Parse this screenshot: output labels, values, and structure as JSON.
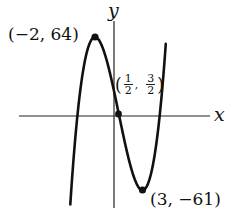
{
  "chart_data": {
    "type": "line",
    "title": "",
    "xlabel": "x",
    "ylabel": "y",
    "function": "cubic with local max (-2, 64), inflection (1/2, 3/2), local min (3, -61)",
    "grid": false,
    "legend": null,
    "x_range": [
      -4.6,
      5.5
    ],
    "y_range": [
      -76,
      90
    ],
    "annotated_points": [
      {
        "label": "(−2, 64)",
        "x": -2,
        "y": 64,
        "kind": "local-max"
      },
      {
        "label": "(1/2, 3/2)",
        "x": 0.5,
        "y": 1.5,
        "kind": "inflection"
      },
      {
        "label": "(3, −61)",
        "x": 3,
        "y": -61,
        "kind": "local-min"
      }
    ],
    "axes": {
      "x_label": "x",
      "y_label": "y",
      "ticks": []
    }
  },
  "labels": {
    "x_axis": "x",
    "y_axis": "y",
    "max_point": "(−2, 64)",
    "min_point": "(3, −61)",
    "inflection_open": "(",
    "inflection_close": ")",
    "inflection_x_num": "1",
    "inflection_x_den": "2",
    "inflection_sep": ",",
    "inflection_y_num": "3",
    "inflection_y_den": "2"
  },
  "colors": {
    "curve": "#111111",
    "axis": "#222222",
    "background": "#ffffff"
  }
}
